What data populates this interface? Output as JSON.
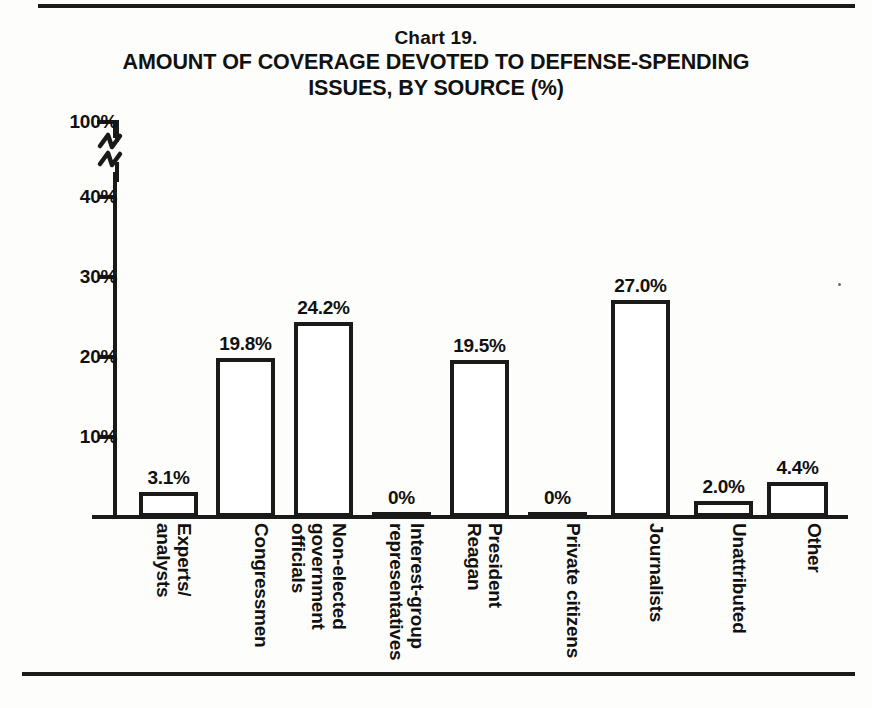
{
  "document": {
    "chart_number": "Chart 19.",
    "title": "AMOUNT OF COVERAGE DEVOTED TO DEFENSE-SPENDING\nISSUES, BY SOURCE (%)"
  },
  "axis": {
    "y_ticks": [
      "100%",
      "40%",
      "30%",
      "20%",
      "10%"
    ],
    "break_note": "axis-break-zigzag"
  },
  "chart_data": {
    "type": "bar",
    "title": "AMOUNT OF COVERAGE DEVOTED TO DEFENSE-SPENDING ISSUES, BY SOURCE (%)",
    "subtitle": "Chart 19.",
    "xlabel": "",
    "ylabel": "",
    "ylim": [
      0,
      100
    ],
    "y_ticks": [
      10,
      20,
      30,
      40,
      100
    ],
    "y_tick_labels": [
      "10%",
      "20%",
      "30%",
      "40%",
      "100%"
    ],
    "axis_break": true,
    "axis_break_between": [
      40,
      100
    ],
    "grid": false,
    "legend": false,
    "categories": [
      "Experts/\nanalysts",
      "Congressmen",
      "Non-elected\ngovernment\nofficials",
      "Interest-group\nrepresentatives",
      "President\nReagan",
      "Private citizens",
      "Journalists",
      "Unattributed",
      "Other"
    ],
    "values": [
      3.1,
      19.8,
      24.2,
      0,
      19.5,
      0,
      27.0,
      2.0,
      4.4
    ],
    "value_labels": [
      "3.1%",
      "19.8%",
      "24.2%",
      "0%",
      "19.5%",
      "0%",
      "27.0%",
      "2.0%",
      "4.4%"
    ],
    "colors": {
      "bar_fill": "#ffffff",
      "bar_stroke": "#1a1a1a",
      "background": "#fdfdfb",
      "text": "#111111"
    }
  },
  "bars": [
    {
      "label": "Experts/\nanalysts",
      "value_label": "3.1%",
      "left": 139,
      "width": 59
    },
    {
      "label": "Congressmen",
      "value_label": "19.8%",
      "left": 216,
      "width": 59
    },
    {
      "label": "Non-elected\ngovernment\nofficials",
      "value_label": "24.2%",
      "left": 294,
      "width": 59
    },
    {
      "label": "Interest-group\nrepresentatives",
      "value_label": "0%",
      "left": 372,
      "width": 59
    },
    {
      "label": "President\nReagan",
      "value_label": "19.5%",
      "left": 450,
      "width": 59
    },
    {
      "label": "Private citizens",
      "value_label": "0%",
      "left": 528,
      "width": 59
    },
    {
      "label": "Journalists",
      "value_label": "27.0%",
      "left": 611,
      "width": 59
    },
    {
      "label": "Unattributed",
      "value_label": "2.0%",
      "left": 694,
      "width": 59
    },
    {
      "label": "Other",
      "value_label": "4.4%",
      "left": 767,
      "width": 61
    }
  ]
}
